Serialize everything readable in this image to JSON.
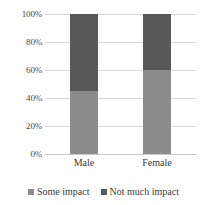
{
  "chart_data": {
    "type": "bar",
    "subtype": "100% stacked bar",
    "title": "",
    "subtitle": "",
    "xlabel": "",
    "ylabel": "",
    "categories": [
      "Male",
      "Female"
    ],
    "series": [
      {
        "name": "Some impact",
        "values": [
          45,
          60
        ],
        "color": "#8c8c8c"
      },
      {
        "name": "Not much impact",
        "values": [
          55,
          40
        ],
        "color": "#585858"
      }
    ],
    "ylim": [
      0,
      100
    ],
    "yticks": [
      0,
      20,
      40,
      60,
      80,
      100
    ],
    "ytick_labels": [
      "0%",
      "20%",
      "40%",
      "60%",
      "80%",
      "100%"
    ],
    "grid": "horizontal",
    "legend_position": "bottom",
    "value_format": "percent"
  },
  "axis": {
    "y_labels": [
      "100%",
      "80%",
      "60%",
      "40%",
      "20%",
      "0%"
    ],
    "x_labels": [
      "Male",
      "Female"
    ]
  },
  "legend": {
    "items": [
      {
        "label": "Some impact",
        "color": "#8c8c8c"
      },
      {
        "label": "Not much impact",
        "color": "#585858"
      }
    ]
  },
  "colors": {
    "some_impact": "#8c8c8c",
    "not_much_impact": "#585858",
    "gridline": "#d9d9d9",
    "baseline": "#c8c8c8",
    "text": "#3a3a3a",
    "background": "#ffffff"
  }
}
